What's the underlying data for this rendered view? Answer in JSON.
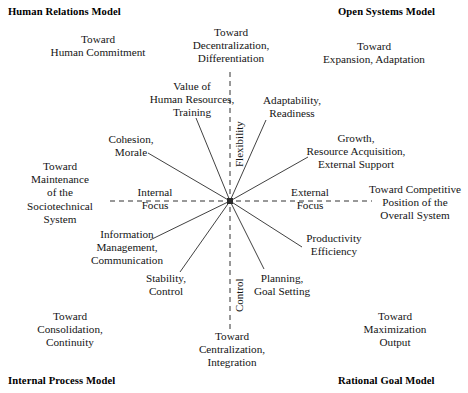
{
  "diagram": {
    "center": {
      "x": 230,
      "y": 201
    },
    "axes": {
      "vertical_top_label": "Flexibility",
      "vertical_bottom_label": "Control",
      "horizontal_left_label": "Internal\nFocus",
      "horizontal_right_label": "External\nFocus",
      "line_color": "#333333",
      "style": "dashed"
    },
    "quadrant_headings": [
      {
        "id": "human-relations-model",
        "text": "Human Relations Model",
        "corner": "top-left"
      },
      {
        "id": "open-systems-model",
        "text": "Open Systems Model",
        "corner": "top-right"
      },
      {
        "id": "internal-process-model",
        "text": "Internal Process Model",
        "corner": "bottom-left"
      },
      {
        "id": "rational-goal-model",
        "text": "Rational Goal Model",
        "corner": "bottom-right"
      }
    ],
    "outcome_labels": [
      {
        "id": "toward-human-commitment",
        "text": "Toward\nHuman Commitment",
        "quadrant": "top-left"
      },
      {
        "id": "toward-decentralization",
        "text": "Toward\nDecentralization,\nDifferentiation",
        "quadrant": "top-center"
      },
      {
        "id": "toward-expansion-adaptation",
        "text": "Toward\nExpansion, Adaptation",
        "quadrant": "top-right"
      },
      {
        "id": "toward-maintenance-sociotechnical",
        "text": "Toward\nMaintenance\nof the\nSociotechnical\nSystem",
        "quadrant": "left-center"
      },
      {
        "id": "toward-competitive-position",
        "text": "Toward Competitive\nPosition of the\nOverall System",
        "quadrant": "right-center"
      },
      {
        "id": "toward-consolidation-continuity",
        "text": "Toward\nConsolidation,\nContinuity",
        "quadrant": "bottom-left"
      },
      {
        "id": "toward-centralization-integration",
        "text": "Toward\nCentralization,\nIntegration",
        "quadrant": "bottom-center"
      },
      {
        "id": "toward-maximization-output",
        "text": "Toward\nMaximization\nOutput",
        "quadrant": "bottom-right"
      }
    ],
    "spoke_labels": [
      {
        "id": "value-of-human-resources",
        "text": "Value of\nHuman Resources,\nTraining"
      },
      {
        "id": "adaptability-readiness",
        "text": "Adaptability,\nReadiness"
      },
      {
        "id": "cohesion-morale",
        "text": "Cohesion,\nMorale"
      },
      {
        "id": "growth-resource-acquisition",
        "text": "Growth,\nResource Acquisition,\nExternal Support"
      },
      {
        "id": "information-management-communication",
        "text": "Information\nManagement,\nCommunication"
      },
      {
        "id": "productivity-efficiency",
        "text": "Productivity\nEfficiency"
      },
      {
        "id": "stability-control",
        "text": "Stability,\nControl"
      },
      {
        "id": "planning-goal-setting",
        "text": "Planning,\nGoal Setting"
      }
    ]
  }
}
